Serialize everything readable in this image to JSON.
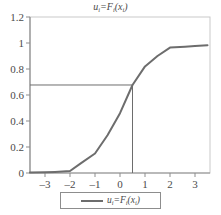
{
  "chart_data": {
    "type": "line",
    "title_parts": {
      "lead": "u",
      "sub1": "i",
      "eq": "=F",
      "sub2": "i",
      "open": "(x",
      "sub3": "i",
      "close": ")"
    },
    "xlabel": "",
    "ylabel": "",
    "xlim": [
      -3.6,
      3.6
    ],
    "ylim": [
      0,
      1.2
    ],
    "xticks": [
      -3,
      -2,
      -1,
      0,
      1,
      2,
      3
    ],
    "xtick_labels": [
      "–3",
      "–2",
      "–1",
      "0",
      "1",
      "2",
      "3"
    ],
    "yticks": [
      0,
      0.2,
      0.4,
      0.6,
      0.8,
      1,
      1.2
    ],
    "ytick_labels": [
      "0",
      "0.2",
      "0.4",
      "0.6",
      "0.8",
      "1",
      "1.2"
    ],
    "grid": false,
    "legend_position": "below-center",
    "series": [
      {
        "name": "uᵢ=Fᵢ(xᵢ)",
        "color": "#6d6d6d",
        "x": [
          -3.6,
          -3.0,
          -2.6,
          -2.0,
          -1.6,
          -1.0,
          -0.5,
          0.0,
          0.5,
          1.0,
          1.5,
          2.0,
          2.6,
          3.0,
          3.5
        ],
        "values": [
          0.003,
          0.005,
          0.008,
          0.015,
          0.07,
          0.15,
          0.29,
          0.46,
          0.677,
          0.82,
          0.9,
          0.965,
          0.972,
          0.977,
          0.982
        ]
      }
    ],
    "annotations": {
      "guide_lines": {
        "color": "#6d6d6d",
        "horizontal_y": 0.677,
        "vertical_x": 0.5,
        "description": "Guide lines from y-axis to curve at u=0.677 and down to x=0.5"
      }
    },
    "legend": {
      "entries": [
        {
          "label": "uᵢ=Fᵢ(xᵢ)",
          "color": "#6d6d6d"
        }
      ]
    }
  },
  "axes": {
    "frame_color": "#b8b8b8",
    "axis_color": "#8d8d8d"
  }
}
